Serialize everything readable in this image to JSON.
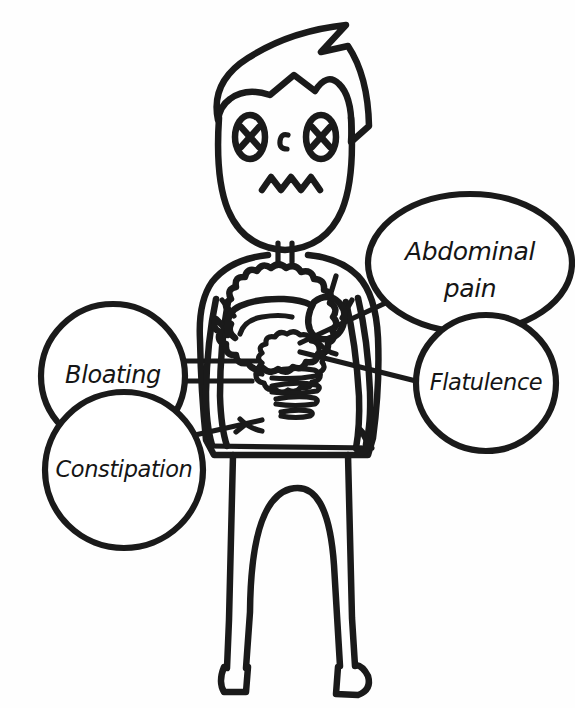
{
  "figure": {
    "background_color": "#fefefe",
    "ink_color": "#1a1a1a"
  },
  "character": {
    "name": "distressed-person",
    "parts": [
      {
        "name": "hair",
        "label": "hair"
      },
      {
        "name": "head",
        "label": "head"
      },
      {
        "name": "eye-left",
        "label": "left eye (crossed out)"
      },
      {
        "name": "eye-right",
        "label": "right eye (crossed out)"
      },
      {
        "name": "nose",
        "label": "nose"
      },
      {
        "name": "mouth",
        "label": "zigzag mouth"
      },
      {
        "name": "neck",
        "label": "neck"
      },
      {
        "name": "torso",
        "label": "torso"
      },
      {
        "name": "arm-left",
        "label": "left arm"
      },
      {
        "name": "arm-right",
        "label": "right arm"
      },
      {
        "name": "abdomen-organs",
        "label": "digestive organs"
      },
      {
        "name": "intestines",
        "label": "intestines"
      },
      {
        "name": "stomach",
        "label": "stomach"
      },
      {
        "name": "liver",
        "label": "liver"
      },
      {
        "name": "legs",
        "label": "legs"
      },
      {
        "name": "foot-left",
        "label": "left foot"
      },
      {
        "name": "foot-right",
        "label": "right foot"
      }
    ]
  },
  "bubbles": [
    {
      "id": "abdominal-pain",
      "line1": "Abdominal",
      "line2": "pain",
      "cx": 470,
      "cy": 263,
      "rx": 102,
      "ry": 69,
      "size": "lg"
    },
    {
      "id": "flatulence",
      "line1": "Flatulence",
      "line2": "",
      "cx": 486,
      "cy": 383,
      "rx": 70,
      "ry": 68,
      "size": "sm"
    },
    {
      "id": "bloating",
      "line1": "Bloating",
      "line2": "",
      "cx": 113,
      "cy": 376,
      "rx": 72,
      "ry": 72,
      "size": "md"
    },
    {
      "id": "constipation",
      "line1": "Constipation",
      "line2": "",
      "cx": 124,
      "cy": 470,
      "rx": 79,
      "ry": 78,
      "size": "sm"
    }
  ],
  "connectors": [
    {
      "id": "connector-bloating",
      "label": "bloating to abdomen"
    },
    {
      "id": "connector-constipation",
      "label": "constipation to abdomen"
    },
    {
      "id": "connector-abdominal-pain",
      "label": "abdominal pain to abdomen"
    },
    {
      "id": "connector-flatulence",
      "label": "flatulence to abdomen"
    }
  ]
}
